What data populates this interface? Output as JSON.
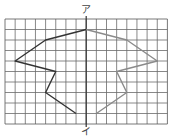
{
  "diagram": {
    "type": "line-symmetric-figure-on-grid",
    "grid": {
      "columns": 16,
      "rows": 10,
      "origin_px": [
        5,
        19
      ],
      "cell_w": 10.15,
      "cell_h": 10.5,
      "line_color": "#6a6a6a",
      "border_color": "#555555"
    },
    "axis": {
      "column": 8,
      "top_label": "ア",
      "bottom_label": "イ",
      "color": "#333333"
    },
    "shape_left": {
      "color": "#333333",
      "points": [
        [
          8,
          1
        ],
        [
          4,
          2
        ],
        [
          1,
          4
        ],
        [
          5,
          5
        ],
        [
          4,
          7
        ],
        [
          7,
          9
        ]
      ]
    },
    "shape_right": {
      "color": "#8a8a8a",
      "points": [
        [
          8,
          1
        ],
        [
          12,
          2
        ],
        [
          15,
          4
        ],
        [
          11,
          5
        ],
        [
          12,
          7
        ],
        [
          9,
          9
        ]
      ]
    }
  }
}
